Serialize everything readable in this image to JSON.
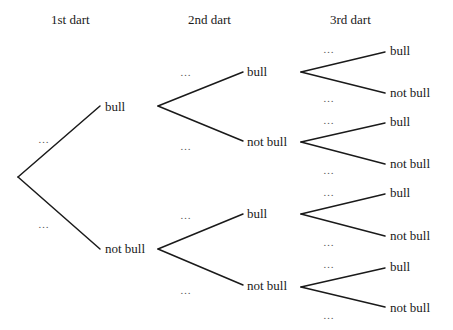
{
  "headers": {
    "level1": "1st dart",
    "level2": "2nd dart",
    "level3": "3rd dart"
  },
  "placeholder": "…",
  "outcomes": {
    "hit": "bull",
    "miss": "not bull"
  },
  "tree": {
    "level1": [
      {
        "label": "bull",
        "prob": "…"
      },
      {
        "label": "not bull",
        "prob": "…"
      }
    ],
    "level2": [
      {
        "parent": "bull",
        "label": "bull",
        "prob": "…"
      },
      {
        "parent": "bull",
        "label": "not bull",
        "prob": "…"
      },
      {
        "parent": "not bull",
        "label": "bull",
        "prob": "…"
      },
      {
        "parent": "not bull",
        "label": "not bull",
        "prob": "…"
      }
    ],
    "level3": [
      {
        "path": "bull, bull",
        "label": "bull",
        "prob": "…"
      },
      {
        "path": "bull, bull",
        "label": "not bull",
        "prob": "…"
      },
      {
        "path": "bull, not bull",
        "label": "bull",
        "prob": "…"
      },
      {
        "path": "bull, not bull",
        "label": "not bull",
        "prob": "…"
      },
      {
        "path": "not bull, bull",
        "label": "bull",
        "prob": "…"
      },
      {
        "path": "not bull, bull",
        "label": "not bull",
        "prob": "…"
      },
      {
        "path": "not bull, not bull",
        "label": "bull",
        "prob": "…"
      },
      {
        "path": "not bull, not bull",
        "label": "not bull",
        "prob": "…"
      }
    ]
  },
  "colors": {
    "line": "#1a1a1a",
    "text": "#1a1a1a",
    "background": "#ffffff"
  }
}
